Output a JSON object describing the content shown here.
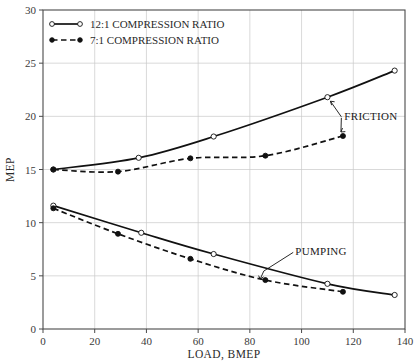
{
  "chart_data": {
    "type": "line",
    "title": "",
    "xlabel": "LOAD, BMEP",
    "ylabel": "MEP",
    "xlim": [
      0,
      140
    ],
    "ylim": [
      0,
      30
    ],
    "xticks": [
      0,
      20,
      40,
      60,
      80,
      100,
      120,
      140
    ],
    "yticks": [
      0,
      5,
      10,
      15,
      20,
      25,
      30
    ],
    "grid": true,
    "legend_position": "top-left",
    "series": [
      {
        "name": "12:1 COMPRESSION RATIO",
        "group": "FRICTION",
        "marker": "open-circle",
        "line": "solid",
        "points": [
          {
            "x": 4,
            "y": 15.0
          },
          {
            "x": 37,
            "y": 16.1
          },
          {
            "x": 66,
            "y": 18.1
          },
          {
            "x": 110,
            "y": 21.8
          },
          {
            "x": 136,
            "y": 24.3
          }
        ]
      },
      {
        "name": "7:1 COMPRESSION RATIO",
        "group": "FRICTION",
        "marker": "filled-circle",
        "line": "dashed",
        "points": [
          {
            "x": 4,
            "y": 15.0
          },
          {
            "x": 29,
            "y": 14.8
          },
          {
            "x": 57,
            "y": 16.05
          },
          {
            "x": 86,
            "y": 16.3
          },
          {
            "x": 116,
            "y": 18.15
          }
        ]
      },
      {
        "name": "12:1 COMPRESSION RATIO",
        "group": "PUMPING",
        "marker": "open-circle",
        "line": "solid",
        "points": [
          {
            "x": 4,
            "y": 11.6
          },
          {
            "x": 38,
            "y": 9.05
          },
          {
            "x": 66,
            "y": 7.05
          },
          {
            "x": 110,
            "y": 4.25
          },
          {
            "x": 136,
            "y": 3.2
          }
        ]
      },
      {
        "name": "7:1 COMPRESSION RATIO",
        "group": "PUMPING",
        "marker": "filled-circle",
        "line": "dashed",
        "points": [
          {
            "x": 4,
            "y": 11.35
          },
          {
            "x": 29,
            "y": 8.95
          },
          {
            "x": 57,
            "y": 6.6
          },
          {
            "x": 86,
            "y": 4.6
          },
          {
            "x": 116,
            "y": 3.5
          }
        ]
      }
    ],
    "annotations": [
      {
        "label": "FRICTION",
        "x": 115,
        "y": 20.0
      },
      {
        "label": "PUMPING",
        "x": 96,
        "y": 7.3
      }
    ]
  },
  "legend": {
    "items": [
      {
        "label": "12:1 COMPRESSION RATIO",
        "marker": "open-circle",
        "line": "solid"
      },
      {
        "label": "7:1 COMPRESSION RATIO",
        "marker": "filled-circle",
        "line": "dashed"
      }
    ]
  },
  "axes": {
    "x": {
      "title": "LOAD, BMEP",
      "tick_labels": [
        "0",
        "20",
        "40",
        "60",
        "80",
        "100",
        "120",
        "140"
      ]
    },
    "y": {
      "title": "MEP",
      "tick_labels": [
        "0",
        "5",
        "10",
        "15",
        "20",
        "25",
        "30"
      ]
    }
  },
  "annotations": {
    "friction_label": "FRICTION",
    "pumping_label": "PUMPING"
  },
  "colors": {
    "line": "#111111",
    "grid": "#c8c8c8",
    "frame": "#4a4a4a",
    "background": "#ffffff"
  }
}
